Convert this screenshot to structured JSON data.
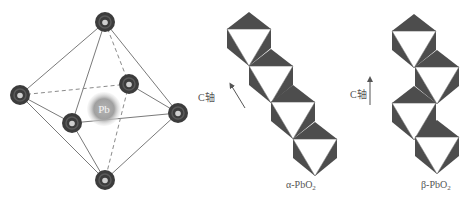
{
  "octahedron": {
    "center_atom_label": "Pb",
    "atom_color": "#3c3c3c",
    "atom_highlight_color": "#cfcfcf",
    "center_atom_color": "#9a9a9a",
    "vertices": [
      "top",
      "left",
      "inner-right",
      "inner-left",
      "right",
      "bottom"
    ],
    "edges": [
      {
        "from": "top",
        "to": "left",
        "style": "solid"
      },
      {
        "from": "top",
        "to": "inner-left",
        "style": "solid"
      },
      {
        "from": "top",
        "to": "inner-right",
        "style": "dashed"
      },
      {
        "from": "top",
        "to": "right",
        "style": "solid"
      },
      {
        "from": "left",
        "to": "inner-right",
        "style": "dashed"
      },
      {
        "from": "left",
        "to": "inner-left",
        "style": "solid"
      },
      {
        "from": "left",
        "to": "bottom",
        "style": "solid"
      },
      {
        "from": "inner-right",
        "to": "right",
        "style": "solid"
      },
      {
        "from": "inner-left",
        "to": "right",
        "style": "solid"
      },
      {
        "from": "inner-right",
        "to": "bottom",
        "style": "dashed"
      },
      {
        "from": "inner-left",
        "to": "bottom",
        "style": "solid"
      },
      {
        "from": "right",
        "to": "bottom",
        "style": "solid"
      }
    ]
  },
  "alpha": {
    "label": "α-PbO",
    "subscript": "2",
    "axis_label": "C轴",
    "chain_units": 4,
    "stacking": "zigzag-diagonal"
  },
  "beta": {
    "label": "β-PbO",
    "subscript": "2",
    "axis_label": "C轴",
    "chain_units": 4,
    "stacking": "zigzag-vertical"
  },
  "colors": {
    "polyhedron_dark": "#4d4d4d",
    "line": "#7a7a7a"
  }
}
